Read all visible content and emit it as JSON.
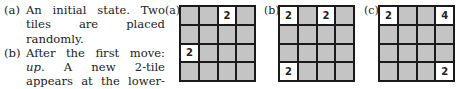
{
  "caption": {
    "items": [
      {
        "label": "(a)",
        "text": "An initial state. Two tiles are placed randomly."
      },
      {
        "label": "(b)",
        "text_before": "After the first move: ",
        "emph": "up",
        "text_after": ". A new 2-tile appears at the lower-left corner."
      }
    ]
  },
  "panels": [
    {
      "label": "(a)",
      "cells": [
        "",
        "",
        "2",
        "",
        "",
        "",
        "",
        "",
        "2",
        "",
        "",
        "",
        "",
        "",
        "",
        ""
      ]
    },
    {
      "label": "(b)",
      "cells": [
        "2",
        "",
        "2",
        "",
        "",
        "",
        "",
        "",
        "",
        "",
        "",
        "",
        "2",
        "",
        "",
        ""
      ]
    },
    {
      "label": "(c)",
      "cells": [
        "2",
        "",
        "",
        "4",
        "",
        "",
        "",
        "",
        "",
        "",
        "",
        "",
        "",
        "",
        "",
        "2"
      ]
    }
  ]
}
